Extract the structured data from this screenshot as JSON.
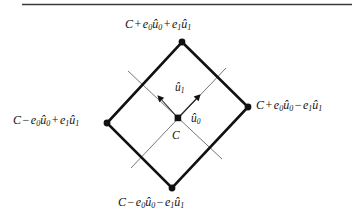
{
  "figure": {
    "title_rule": "horizontal-rule",
    "background_color": "#ffffff",
    "stroke_color": "#111111",
    "line_color_thin": "#555555"
  },
  "diagram": {
    "type": "oriented-bounding-box-diagram",
    "shape": "diamond",
    "center_label": "C",
    "vertices": [
      {
        "name": "top",
        "x": 182,
        "y": 42,
        "label_id": "label-top"
      },
      {
        "name": "right",
        "x": 248,
        "y": 107,
        "label_id": "label-right"
      },
      {
        "name": "bottom",
        "x": 172,
        "y": 188,
        "label_id": "label-bottom"
      },
      {
        "name": "left",
        "x": 107,
        "y": 123,
        "label_id": "label-left"
      }
    ],
    "center_point": {
      "x": 178,
      "y": 118
    },
    "axes": [
      {
        "name": "u0",
        "label_id": "label-u0",
        "direction": "up-right"
      },
      {
        "name": "u1",
        "label_id": "label-u1",
        "direction": "up-left"
      }
    ]
  },
  "labels": {
    "top": {
      "C": "C",
      "op1": "+",
      "e0": "e",
      "e0_sub": "0",
      "u0": "û",
      "u0_sub": "0",
      "op2": "+",
      "e1": "e",
      "e1_sub": "1",
      "u1": "û",
      "u1_sub": "1",
      "plain": "C + e0û0 + e1û1"
    },
    "right": {
      "C": "C",
      "op1": "+",
      "e0": "e",
      "e0_sub": "0",
      "u0": "û",
      "u0_sub": "0",
      "op2": "−",
      "e1": "e",
      "e1_sub": "1",
      "u1": "û",
      "u1_sub": "1",
      "plain": "C + e0û0 − e1û1"
    },
    "bottom": {
      "C": "C",
      "op1": "−",
      "e0": "e",
      "e0_sub": "0",
      "u0": "û",
      "u0_sub": "0",
      "op2": "−",
      "e1": "e",
      "e1_sub": "1",
      "u1": "û",
      "u1_sub": "1",
      "plain": "C − e0û0 − e1û1"
    },
    "left": {
      "C": "C",
      "op1": "−",
      "e0": "e",
      "e0_sub": "0",
      "u0": "û",
      "u0_sub": "0",
      "op2": "+",
      "e1": "e",
      "e1_sub": "1",
      "u1": "û",
      "u1_sub": "1",
      "plain": "C − e0û0 + e1û1"
    },
    "axis_u0": {
      "glyph": "û",
      "sub": "0"
    },
    "axis_u1": {
      "glyph": "û",
      "sub": "1"
    },
    "center": {
      "glyph": "C"
    }
  }
}
